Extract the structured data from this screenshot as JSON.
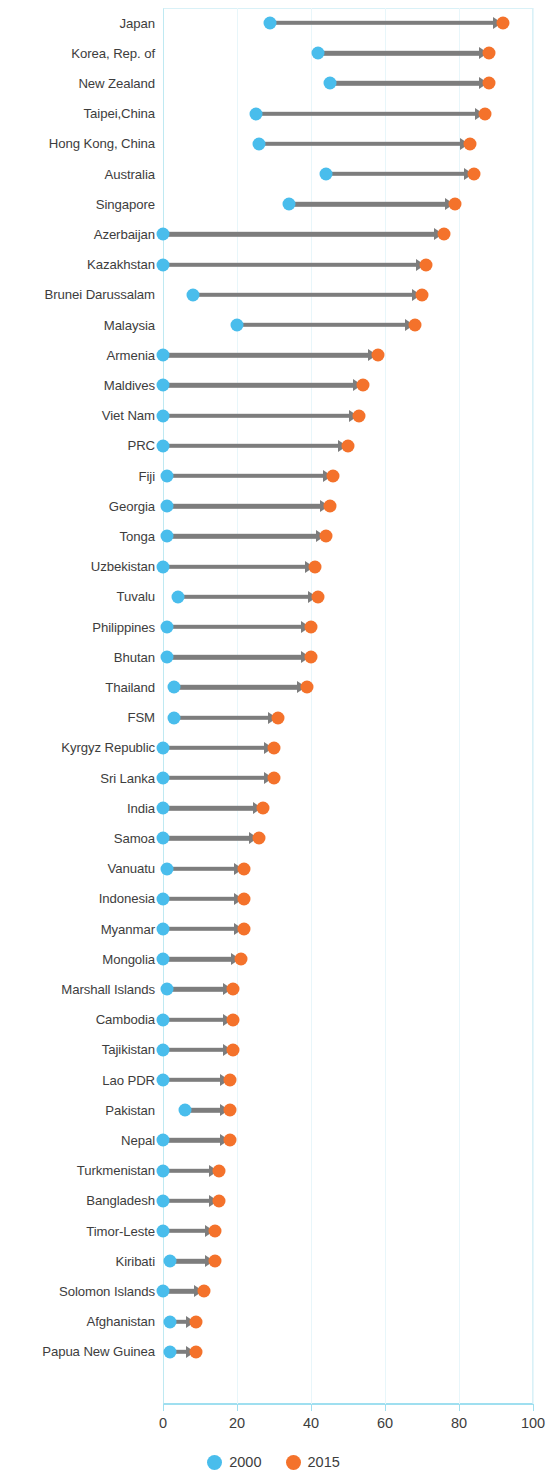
{
  "chart_data": {
    "type": "bar",
    "subtype": "dumbbell-arrow-plot",
    "title": "",
    "subtitle": "",
    "xlabel": "",
    "ylabel": "",
    "xlim": [
      0,
      100
    ],
    "ylim": null,
    "grid": true,
    "grid_axis": "x",
    "legend_position": "bottom-center",
    "x_ticks": [
      0,
      20,
      40,
      60,
      80,
      100
    ],
    "x_tick_labels": [
      "0",
      "20",
      "40",
      "60",
      "80",
      "100"
    ],
    "legend": [
      {
        "name": "2000",
        "color": "#49bdec"
      },
      {
        "name": "2015",
        "color": "#f4722b"
      }
    ],
    "series": [
      {
        "name": "2000",
        "color": "#49bdec",
        "values": [
          29,
          42,
          45,
          25,
          26,
          44,
          34,
          0,
          0,
          8,
          20,
          0,
          0,
          0,
          0,
          1,
          1,
          1,
          0,
          4,
          1,
          1,
          3,
          3,
          0,
          0,
          0,
          0,
          1,
          0,
          0,
          0,
          1,
          0,
          0,
          0,
          6,
          0,
          0,
          0,
          0,
          2,
          0,
          2,
          2
        ]
      },
      {
        "name": "2015",
        "color": "#f4722b",
        "values": [
          92,
          88,
          88,
          87,
          83,
          84,
          79,
          76,
          71,
          70,
          68,
          58,
          54,
          53,
          50,
          46,
          45,
          44,
          41,
          42,
          40,
          40,
          39,
          31,
          30,
          30,
          27,
          26,
          22,
          22,
          22,
          21,
          19,
          19,
          19,
          18,
          18,
          18,
          15,
          15,
          14,
          14,
          11,
          9,
          9
        ]
      }
    ],
    "categories": [
      "Japan",
      "Korea, Rep. of",
      "New Zealand",
      "Taipei,China",
      "Hong Kong, China",
      "Australia",
      "Singapore",
      "Azerbaijan",
      "Kazakhstan",
      "Brunei Darussalam",
      "Malaysia",
      "Armenia",
      "Maldives",
      "Viet Nam",
      "PRC",
      "Fiji",
      "Georgia",
      "Tonga",
      "Uzbekistan",
      "Tuvalu",
      "Philippines",
      "Bhutan",
      "Thailand",
      "FSM",
      "Kyrgyz Republic",
      "Sri Lanka",
      "India",
      "Samoa",
      "Vanuatu",
      "Indonesia",
      "Myanmar",
      "Mongolia",
      "Marshall Islands",
      "Cambodia",
      "Tajikistan",
      "Lao PDR",
      "Pakistan",
      "Nepal",
      "Turkmenistan",
      "Bangladesh",
      "Timor-Leste",
      "Kiribati",
      "Solomon Islands",
      "Afghanistan",
      "Papua New Guinea"
    ]
  },
  "colors": {
    "start": "#49bdec",
    "end": "#f4722b",
    "connector": "#7d7d7d",
    "axis": "#9fdff0",
    "grid": "#e8f6fa",
    "text": "#3d3d3d"
  }
}
